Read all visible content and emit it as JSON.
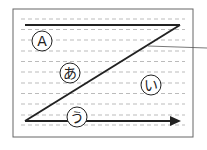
{
  "diagram": {
    "frame": {
      "x": 13,
      "y": 9,
      "width": 180,
      "height": 128,
      "stroke": "#666666"
    },
    "guide_lines": {
      "y_positions": [
        19,
        29.5,
        40,
        51,
        61.5,
        72,
        83,
        93.5,
        104,
        115,
        125
      ],
      "x_start": 21,
      "x_end": 185,
      "color": "#bbbbbb"
    },
    "top_line": {
      "x1": 25,
      "y1": 25,
      "x2": 180,
      "y2": 25
    },
    "diagonal": {
      "x1": 25,
      "y1": 121,
      "x2": 180,
      "y2": 25
    },
    "arrow": {
      "x1": 25,
      "y1": 121,
      "x2": 181,
      "y2": 121
    },
    "leader_line": {
      "x1": 148,
      "y1": 46,
      "x2": 207,
      "y2": 48
    },
    "labels": [
      {
        "id": "A",
        "text": "A",
        "cx": 42,
        "cy": 41,
        "r": 10
      },
      {
        "id": "a",
        "text": "あ",
        "cx": 70,
        "cy": 73,
        "r": 10
      },
      {
        "id": "i",
        "text": "い",
        "cx": 151,
        "cy": 85,
        "r": 10
      },
      {
        "id": "u",
        "text": "う",
        "cx": 77,
        "cy": 117,
        "r": 10
      }
    ],
    "line_color": "#222222"
  }
}
